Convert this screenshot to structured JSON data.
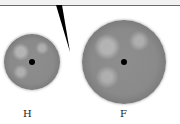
{
  "diagram": {
    "callout": {
      "background": "#f2f2f2",
      "border": "#6a6a6a"
    },
    "spheres": [
      {
        "id": "H",
        "label": "H",
        "size": "small",
        "color": "#8a8a8a"
      },
      {
        "id": "F",
        "label": "F",
        "size": "large",
        "color": "#8a8a8a"
      }
    ]
  }
}
